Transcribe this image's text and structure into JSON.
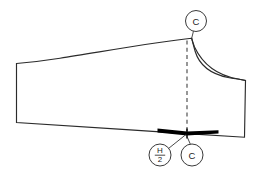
{
  "diagram": {
    "background_color": "#ffffff",
    "outline_color": "#2b2b2b",
    "notch_color": "#000000",
    "dash_color": "#3a3a3a",
    "callouts": [
      {
        "id": "top-c",
        "label": "C",
        "cx": 196,
        "cy": 21,
        "r": 10.5,
        "kind": "letter"
      },
      {
        "id": "bottom-h-over-2",
        "label_numerator": "H",
        "label_denominator": "2",
        "cx": 160,
        "cy": 155,
        "r": 11,
        "kind": "fraction"
      },
      {
        "id": "bottom-c",
        "label": "C",
        "cx": 192,
        "cy": 155,
        "r": 11,
        "kind": "letter"
      }
    ],
    "markers": {
      "center_line_label": "C",
      "half_hip_label": "H/2",
      "notch_description": "hip level notch bar",
      "dash_description": "vertical centre construction line"
    }
  }
}
